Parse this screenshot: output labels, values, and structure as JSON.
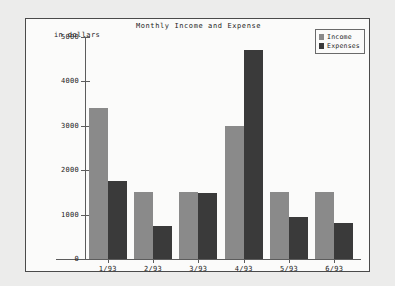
{
  "frame": {
    "background_color": "#fbfbfa",
    "border_color": "#4a4a4a",
    "page_background_color": "#ececeb"
  },
  "title": "Monthly Income and Expense",
  "axis_label_y": "in dollars",
  "legend": {
    "entries": [
      {
        "label": "Income",
        "color": "#8a8a8a"
      },
      {
        "label": "Expenses",
        "color": "#3a3a3a"
      }
    ]
  },
  "chart_data": {
    "type": "bar",
    "title": "Monthly Income and Expense",
    "xlabel": "",
    "ylabel": "in dollars",
    "categories": [
      "1/93",
      "2/93",
      "3/93",
      "4/93",
      "5/93",
      "6/93"
    ],
    "series": [
      {
        "name": "Income",
        "color": "#8a8a8a",
        "values": [
          3400,
          1500,
          1500,
          3000,
          1500,
          1500
        ]
      },
      {
        "name": "Expenses",
        "color": "#3a3a3a",
        "values": [
          1750,
          750,
          1480,
          4700,
          950,
          800
        ]
      }
    ],
    "ylim": [
      0,
      5000
    ],
    "yticks": [
      0,
      1000,
      2000,
      3000,
      4000,
      5000
    ],
    "ytick_labels": [
      "0",
      "1000",
      "2000",
      "3000",
      "4000",
      "5000"
    ],
    "grid": false,
    "legend_position": "top-right"
  }
}
